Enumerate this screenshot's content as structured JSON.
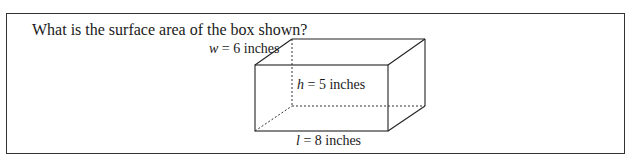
{
  "question": {
    "text": "What is the surface area of the box shown?"
  },
  "figure": {
    "type": "rectangular-prism",
    "labels": {
      "width": {
        "var": "w",
        "rest": " = 6 inches"
      },
      "height": {
        "var": "h",
        "rest": " = 5 inches"
      },
      "length": {
        "var": "l",
        "rest": " = 8 inches"
      }
    },
    "dimensions": {
      "length_in": 8,
      "width_in": 6,
      "height_in": 5
    }
  }
}
